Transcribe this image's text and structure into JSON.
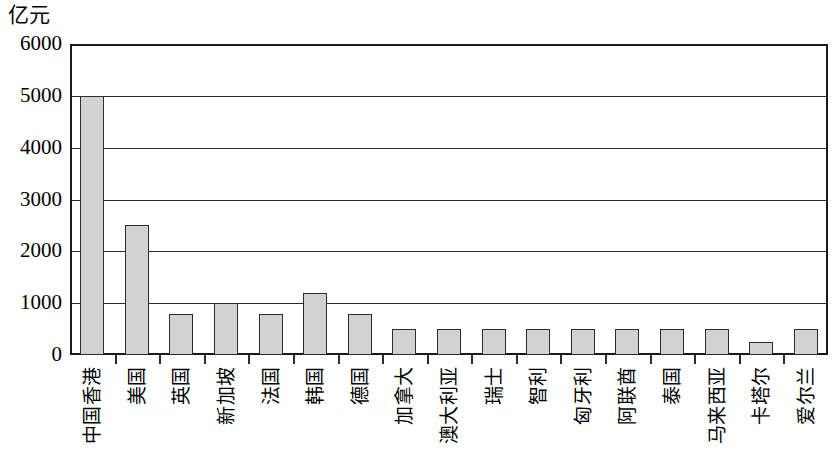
{
  "chart_data": {
    "type": "bar",
    "title": "",
    "subtitle": "",
    "xlabel": "",
    "ylabel": "亿元",
    "ylim": [
      0,
      6000
    ],
    "ytick_labels": [
      "6000",
      "5000",
      "4000",
      "3000",
      "2000",
      "1000",
      "0"
    ],
    "ytick_values": [
      6000,
      5000,
      4000,
      3000,
      2000,
      1000,
      0
    ],
    "grid": true,
    "legend": false,
    "categories": [
      "中国香港",
      "美国",
      "英国",
      "新加坡",
      "法国",
      "韩国",
      "德国",
      "加拿大",
      "澳大利亚",
      "瑞士",
      "智利",
      "匈牙利",
      "阿联酋",
      "泰国",
      "马来西亚",
      "卡塔尔",
      "爱尔兰"
    ],
    "values": [
      5000,
      2500,
      800,
      1000,
      800,
      1200,
      800,
      500,
      500,
      500,
      500,
      500,
      500,
      500,
      500,
      250,
      500
    ],
    "bar_fill_color": "#d2d2d2",
    "bar_border_color": "#2b2b2b",
    "axis_color": "#1b1b1b"
  }
}
